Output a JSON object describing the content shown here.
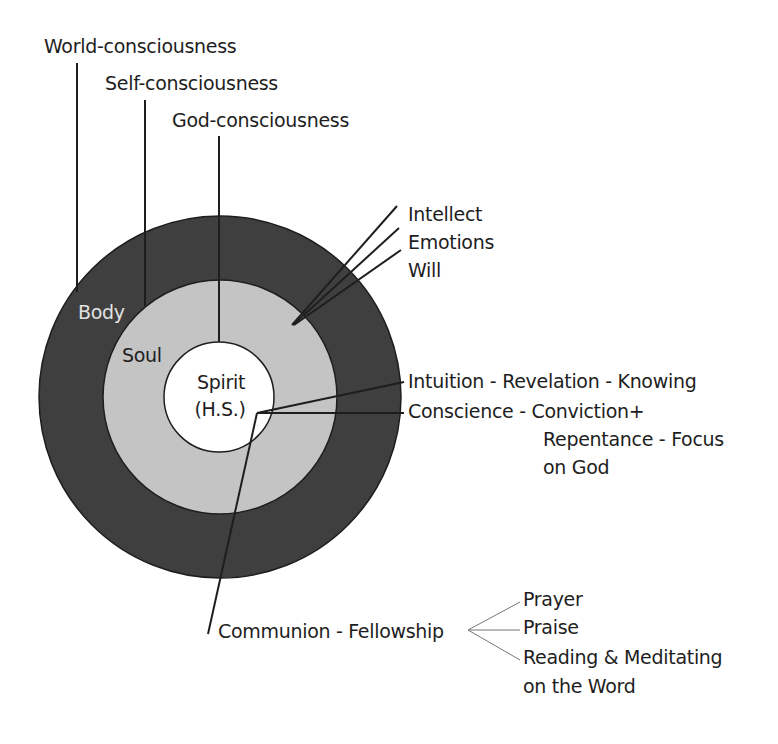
{
  "diagram": {
    "type": "concentric-circles",
    "colors": {
      "body_ring": "#3f3f3f",
      "soul_ring": "#c4c4c4",
      "spirit_core": "#ffffff",
      "lines": "#1e1e1e",
      "text": "#1e1e1e",
      "body_label_text": "#e2e2e2"
    },
    "consciousness": {
      "world": "World-consciousness",
      "self": "Self-consciousness",
      "god": "God-consciousness"
    },
    "rings": {
      "body": "Body",
      "soul": "Soul",
      "spirit_line1": "Spirit",
      "spirit_line2": "(H.S.)"
    },
    "soul_functions": [
      "Intellect",
      "Emotions",
      "Will"
    ],
    "spirit_functions": {
      "intuition": "Intuition - Revelation - Knowing",
      "conscience_line1": "Conscience - Conviction+",
      "conscience_line2": "Repentance - Focus",
      "conscience_line3": "on God",
      "communion": "Communion - Fellowship"
    },
    "communion_branches": [
      "Prayer",
      "Praise",
      "Reading & Meditating",
      "on the Word"
    ]
  }
}
